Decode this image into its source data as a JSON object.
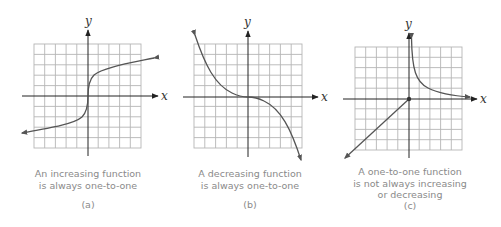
{
  "figure": {
    "colors": {
      "grid": "#b5b5b5",
      "axis": "#222222",
      "curve": "#555555",
      "caption": "#8a8a8a"
    },
    "axis_labels": {
      "x": "x",
      "y": "y"
    },
    "panels": [
      {
        "id": "a",
        "sublabel": "(a)",
        "caption_lines": [
          "An increasing function",
          "is always one-to-one"
        ],
        "function_shape": "cube-root-like increasing curve through origin",
        "grid": {
          "cols": 10,
          "rows": 10
        }
      },
      {
        "id": "b",
        "sublabel": "(b)",
        "caption_lines": [
          "A decreasing function",
          "is always one-to-one"
        ],
        "function_shape": "cubic-like decreasing curve, flat at origin",
        "grid": {
          "cols": 10,
          "rows": 10
        }
      },
      {
        "id": "c",
        "sublabel": "(c)",
        "caption_lines": [
          "A one-to-one function",
          "is not always increasing",
          "or decreasing"
        ],
        "function_shape": "line y=x for x<=0 with closed dot at origin; reciprocal-like branch for x>0",
        "grid": {
          "cols": 10,
          "rows": 10
        }
      }
    ]
  }
}
